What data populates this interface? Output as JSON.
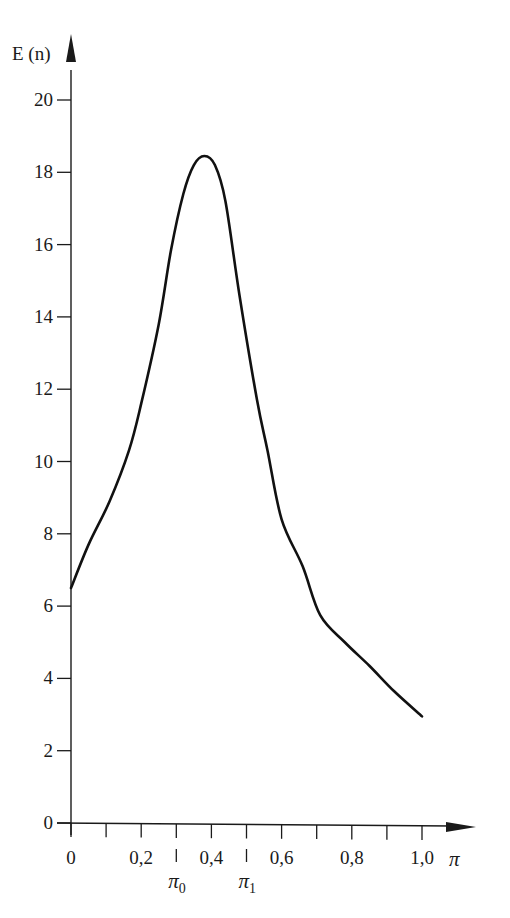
{
  "chart_data": {
    "type": "line",
    "title": "",
    "xlabel": "π",
    "ylabel": "E (n)",
    "xlim": [
      0,
      1.0
    ],
    "ylim": [
      0,
      20
    ],
    "grid": false,
    "legend": null,
    "x_tick_labels": [
      "0",
      "0,2",
      "0,4",
      "0,6",
      "0,8",
      "1,0"
    ],
    "x_tick_values": [
      0,
      0.2,
      0.4,
      0.6,
      0.8,
      1.0
    ],
    "x_minor_ticks": [
      0.1,
      0.3,
      0.5,
      0.7,
      0.9
    ],
    "y_tick_labels": [
      "0",
      "2",
      "4",
      "6",
      "8",
      "10",
      "12",
      "14",
      "16",
      "18",
      "20"
    ],
    "y_tick_values": [
      0,
      2,
      4,
      6,
      8,
      10,
      12,
      14,
      16,
      18,
      20
    ],
    "annotations": [
      {
        "label": "π",
        "subscript": "0",
        "x": 0.3
      },
      {
        "label": "π",
        "subscript": "1",
        "x": 0.5
      }
    ],
    "series": [
      {
        "name": "E(n)",
        "x": [
          0.0,
          0.05,
          0.11,
          0.165,
          0.2,
          0.25,
          0.285,
          0.32,
          0.35,
          0.38,
          0.41,
          0.44,
          0.48,
          0.53,
          0.56,
          0.6,
          0.66,
          0.71,
          0.78,
          0.85,
          0.92,
          1.0
        ],
        "values": [
          6.5,
          7.7,
          8.9,
          10.3,
          11.6,
          13.8,
          15.85,
          17.4,
          18.2,
          18.45,
          18.2,
          17.2,
          14.6,
          11.7,
          10.3,
          8.4,
          7.1,
          5.75,
          5.0,
          4.35,
          3.65,
          2.95
        ]
      }
    ]
  }
}
